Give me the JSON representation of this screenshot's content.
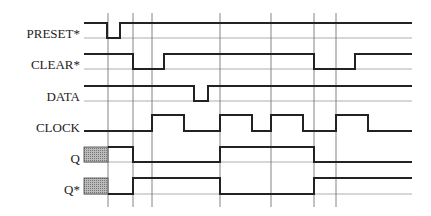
{
  "diagram": {
    "type": "timing-diagram",
    "signals": [
      {
        "name": "PRESET*",
        "label_y": 26
      },
      {
        "name": "CLEAR*",
        "label_y": 57
      },
      {
        "name": "DATA",
        "label_y": 89
      },
      {
        "name": "CLOCK",
        "label_y": 120
      },
      {
        "name": "Q",
        "label_y": 151
      },
      {
        "name": "Q*",
        "label_y": 182
      }
    ],
    "vertical_markers_x": [
      108,
      133,
      152,
      220,
      271,
      314,
      336
    ],
    "colors": {
      "signal": "#222222",
      "grid": "#888888",
      "hatch": "#999999"
    }
  }
}
